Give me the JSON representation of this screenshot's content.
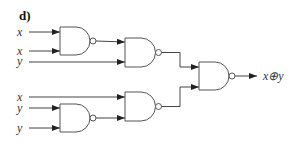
{
  "figure": {
    "label": "d)",
    "type": "NAND-gate circuit implementing XOR",
    "output_label": "x⊕y"
  },
  "inputs": [
    {
      "id": "in1",
      "label": "x",
      "y": 32
    },
    {
      "id": "in2",
      "label": "x",
      "y": 51
    },
    {
      "id": "in3",
      "label": "y",
      "y": 62
    },
    {
      "id": "in4",
      "label": "x",
      "y": 97
    },
    {
      "id": "in5",
      "label": "y",
      "y": 108
    },
    {
      "id": "in6",
      "label": "y",
      "y": 128
    }
  ],
  "gates": [
    {
      "id": "g1",
      "type": "NAND",
      "inputs": [
        "x",
        "x"
      ]
    },
    {
      "id": "g2",
      "type": "NAND",
      "inputs": [
        "g1",
        "y"
      ]
    },
    {
      "id": "g3",
      "type": "NAND",
      "inputs": [
        "x",
        "g4"
      ]
    },
    {
      "id": "g4",
      "type": "NAND",
      "inputs": [
        "y",
        "y"
      ]
    },
    {
      "id": "g5",
      "type": "NAND",
      "inputs": [
        "g2",
        "g3"
      ],
      "output": "x⊕y"
    }
  ],
  "colors": {
    "wire": "#444444",
    "gate_stroke": "#555555",
    "background": "#ffffff"
  }
}
